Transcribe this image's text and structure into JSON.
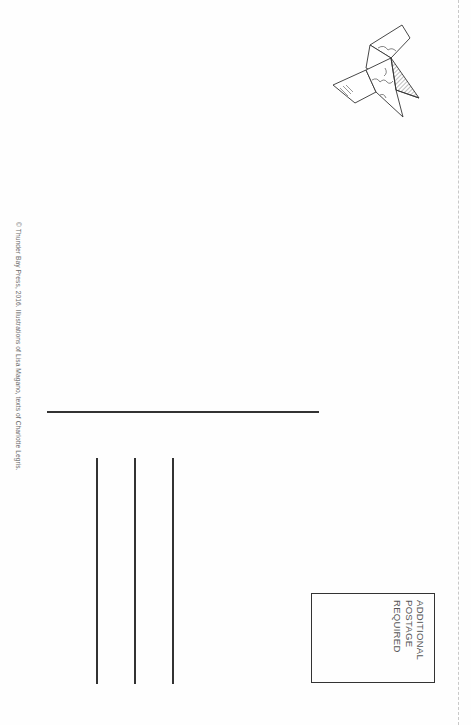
{
  "postcard": {
    "copyright": "© Thunder Bay Press, 2016. Illustrations of Lisa Magano, texts of Charlotte Legris.",
    "stamp_box": {
      "lines": [
        "ADDITIONAL",
        "POSTAGE",
        "REQUIRED"
      ]
    },
    "illustration": "origami-bird-icon",
    "colors": {
      "ink": "#333333",
      "paper": "#fefefe"
    }
  }
}
